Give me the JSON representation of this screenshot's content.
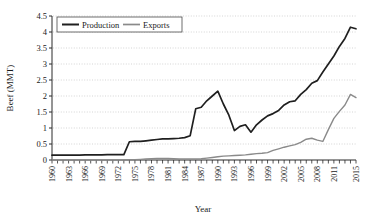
{
  "chart_data": {
    "type": "line",
    "title": "",
    "xlabel": "Year",
    "ylabel": "Beef (MMT)",
    "xlim": [
      1960,
      2015
    ],
    "ylim": [
      0,
      4.5
    ],
    "ytick_labels": [
      "0",
      "0.5",
      "1",
      "1.5",
      "2",
      "2.5",
      "3",
      "3.5",
      "4",
      "4.5"
    ],
    "ytick_values": [
      0,
      0.5,
      1,
      1.5,
      2,
      2.5,
      3,
      3.5,
      4,
      4.5
    ],
    "xtick_labels": [
      "1960",
      "1963",
      "1966",
      "1969",
      "1972",
      "1975",
      "1978",
      "1981",
      "1984",
      "1987",
      "1990",
      "1993",
      "1996",
      "1999",
      "2002",
      "2005",
      "2008",
      "2011",
      "2015"
    ],
    "xtick_values": [
      1960,
      1963,
      1966,
      1969,
      1972,
      1975,
      1978,
      1981,
      1984,
      1987,
      1990,
      1993,
      1996,
      1999,
      2002,
      2005,
      2008,
      2011,
      2015
    ],
    "grid": "horizontal-dotted",
    "legend_position": "top-left-inside",
    "x": [
      1960,
      1961,
      1962,
      1963,
      1964,
      1965,
      1966,
      1967,
      1968,
      1969,
      1970,
      1971,
      1972,
      1973,
      1974,
      1975,
      1976,
      1977,
      1978,
      1979,
      1980,
      1981,
      1982,
      1983,
      1984,
      1985,
      1986,
      1987,
      1988,
      1989,
      1990,
      1991,
      1992,
      1993,
      1994,
      1995,
      1996,
      1997,
      1998,
      1999,
      2000,
      2001,
      2002,
      2003,
      2004,
      2005,
      2006,
      2007,
      2008,
      2009,
      2010,
      2011,
      2012,
      2013,
      2014,
      2015
    ],
    "series": [
      {
        "name": "Production",
        "color": "#1f1f1f",
        "width": 1.7,
        "values": [
          0.15,
          0.15,
          0.15,
          0.15,
          0.15,
          0.15,
          0.16,
          0.16,
          0.16,
          0.16,
          0.17,
          0.17,
          0.17,
          0.17,
          0.57,
          0.58,
          0.58,
          0.6,
          0.62,
          0.64,
          0.66,
          0.66,
          0.67,
          0.68,
          0.7,
          0.76,
          1.6,
          1.65,
          1.85,
          2.0,
          2.15,
          1.75,
          1.4,
          0.92,
          1.05,
          1.1,
          0.87,
          1.1,
          1.25,
          1.38,
          1.45,
          1.55,
          1.72,
          1.82,
          1.85,
          2.05,
          2.2,
          2.4,
          2.48,
          2.75,
          3.0,
          3.25,
          3.55,
          3.8,
          4.15,
          4.1
        ]
      },
      {
        "name": "Exports",
        "color": "#8a8a8a",
        "width": 1.4,
        "values": [
          0.0,
          0.0,
          0.0,
          0.0,
          0.0,
          0.0,
          0.0,
          0.0,
          0.0,
          0.0,
          0.0,
          0.0,
          0.0,
          0.0,
          0.01,
          0.01,
          0.02,
          0.03,
          0.04,
          0.05,
          0.05,
          0.05,
          0.04,
          0.03,
          0.03,
          0.03,
          0.03,
          0.04,
          0.06,
          0.08,
          0.1,
          0.12,
          0.13,
          0.14,
          0.15,
          0.16,
          0.18,
          0.2,
          0.21,
          0.23,
          0.3,
          0.35,
          0.4,
          0.44,
          0.48,
          0.55,
          0.65,
          0.68,
          0.62,
          0.58,
          0.95,
          1.3,
          1.52,
          1.72,
          2.05,
          1.95
        ]
      }
    ]
  },
  "legend": {
    "items": [
      {
        "label": "Production"
      },
      {
        "label": "Exports"
      }
    ]
  },
  "axes": {
    "y_title": "Beef (MMT)",
    "x_title": "Year"
  },
  "colors": {
    "production": "#1f1f1f",
    "exports": "#8a8a8a",
    "grid": "#b9b9b9",
    "axis": "#2a2a2a",
    "background": "#ffffff"
  }
}
